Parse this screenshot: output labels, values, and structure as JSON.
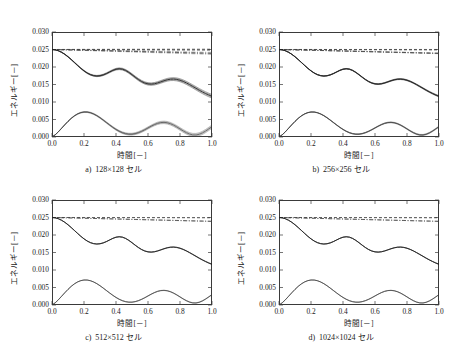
{
  "page_header": "",
  "figure": {
    "axis": {
      "xlabel": "時間[－]",
      "ylabel": "エネルギー[－]",
      "xticks": [
        "0.0",
        "0.2",
        "0.4",
        "0.6",
        "0.8",
        "1.0"
      ],
      "yticks": [
        "0.000",
        "0.005",
        "0.010",
        "0.015",
        "0.020",
        "0.025",
        "0.030"
      ],
      "xlim": [
        0.0,
        1.0
      ],
      "ylim": [
        0.0,
        0.03
      ]
    },
    "panels": [
      {
        "letter": "a)",
        "title": "128×128 セル",
        "spread": 1.0
      },
      {
        "letter": "b)",
        "title": "256×256 セル",
        "spread": 0.34
      },
      {
        "letter": "c)",
        "title": "512×512 セル",
        "spread": 0.14
      },
      {
        "letter": "d)",
        "title": "1024×1024 セル",
        "spread": 0.07
      }
    ]
  },
  "chart_data": {
    "type": "line",
    "title": "",
    "xlabel": "時間[－]",
    "ylabel": "エネルギー[－]",
    "xlim": [
      0.0,
      1.0
    ],
    "ylim": [
      0.0,
      0.03
    ],
    "xticks": [
      0.0,
      0.2,
      0.4,
      0.6,
      0.8,
      1.0
    ],
    "yticks": [
      0.0,
      0.005,
      0.01,
      0.015,
      0.02,
      0.025,
      0.03
    ],
    "grid": false,
    "legend": null,
    "x": [
      0.0,
      0.02,
      0.04,
      0.06,
      0.08,
      0.1,
      0.12,
      0.14,
      0.16,
      0.18,
      0.2,
      0.22,
      0.24,
      0.26,
      0.28,
      0.3,
      0.32,
      0.34,
      0.36,
      0.38,
      0.4,
      0.42,
      0.44,
      0.46,
      0.48,
      0.5,
      0.52,
      0.54,
      0.56,
      0.58,
      0.6,
      0.62,
      0.64,
      0.66,
      0.68,
      0.7,
      0.72,
      0.74,
      0.76,
      0.78,
      0.8,
      0.82,
      0.84,
      0.86,
      0.88,
      0.9,
      0.92,
      0.94,
      0.96,
      0.98,
      1.0
    ],
    "series": [
      {
        "name": "total-energy-flat",
        "style": "dashed",
        "values": [
          0.025,
          0.025,
          0.025,
          0.025,
          0.025,
          0.025,
          0.025,
          0.025,
          0.025,
          0.025,
          0.025,
          0.025,
          0.02499,
          0.02499,
          0.02499,
          0.02499,
          0.02499,
          0.02499,
          0.02499,
          0.02499,
          0.02499,
          0.02498,
          0.02498,
          0.02498,
          0.02498,
          0.02498,
          0.02498,
          0.02498,
          0.02498,
          0.02498,
          0.02497,
          0.02497,
          0.02497,
          0.02497,
          0.02497,
          0.02497,
          0.02497,
          0.02497,
          0.02496,
          0.02496,
          0.02496,
          0.02496,
          0.02496,
          0.02496,
          0.02496,
          0.02496,
          0.02495,
          0.02495,
          0.02495,
          0.02495,
          0.02495
        ]
      },
      {
        "name": "total-energy-decaying",
        "style": "dash-dot",
        "values": [
          0.025,
          0.02498,
          0.02496,
          0.02494,
          0.02492,
          0.0249,
          0.02488,
          0.02486,
          0.02484,
          0.02482,
          0.0248,
          0.02477,
          0.02475,
          0.02473,
          0.02471,
          0.02469,
          0.02466,
          0.02464,
          0.02462,
          0.0246,
          0.02457,
          0.02455,
          0.02453,
          0.02451,
          0.02448,
          0.02446,
          0.02444,
          0.02442,
          0.02439,
          0.02437,
          0.02435,
          0.02433,
          0.0243,
          0.02428,
          0.02426,
          0.02424,
          0.02421,
          0.02419,
          0.02417,
          0.02415,
          0.02412,
          0.0241,
          0.02408,
          0.02406,
          0.02403,
          0.02401,
          0.02399,
          0.02397,
          0.02394,
          0.02392,
          0.0239
        ]
      },
      {
        "name": "kinetic-energy",
        "style": "solid",
        "values": [
          0.025,
          0.02491,
          0.02464,
          0.02421,
          0.02363,
          0.02293,
          0.02214,
          0.0213,
          0.02045,
          0.01963,
          0.0189,
          0.01828,
          0.01782,
          0.01753,
          0.01742,
          0.0175,
          0.01774,
          0.01812,
          0.01858,
          0.01903,
          0.01937,
          0.0195,
          0.01938,
          0.01902,
          0.01847,
          0.0178,
          0.01709,
          0.01642,
          0.01585,
          0.01543,
          0.01518,
          0.01511,
          0.01521,
          0.01544,
          0.01575,
          0.01607,
          0.01634,
          0.01651,
          0.01655,
          0.01645,
          0.01622,
          0.01588,
          0.01545,
          0.01496,
          0.01444,
          0.01391,
          0.01338,
          0.01288,
          0.01242,
          0.012,
          0.01163
        ]
      },
      {
        "name": "dissipation-energy",
        "style": "solid-thin",
        "values": [
          0.0,
          0.00062,
          0.0015,
          0.00249,
          0.0035,
          0.00446,
          0.00532,
          0.00604,
          0.00659,
          0.00696,
          0.00714,
          0.00713,
          0.00694,
          0.00659,
          0.0061,
          0.00551,
          0.00484,
          0.00414,
          0.00344,
          0.00277,
          0.00216,
          0.00164,
          0.00123,
          0.00095,
          0.00081,
          0.00081,
          0.00096,
          0.00124,
          0.00162,
          0.00208,
          0.00259,
          0.00309,
          0.00354,
          0.0039,
          0.00412,
          0.00418,
          0.00407,
          0.0038,
          0.00339,
          0.00288,
          0.00231,
          0.00174,
          0.00123,
          0.00083,
          0.0006,
          0.00058,
          0.00078,
          0.00117,
          0.0017,
          0.00232,
          0.00297
        ]
      }
    ]
  }
}
